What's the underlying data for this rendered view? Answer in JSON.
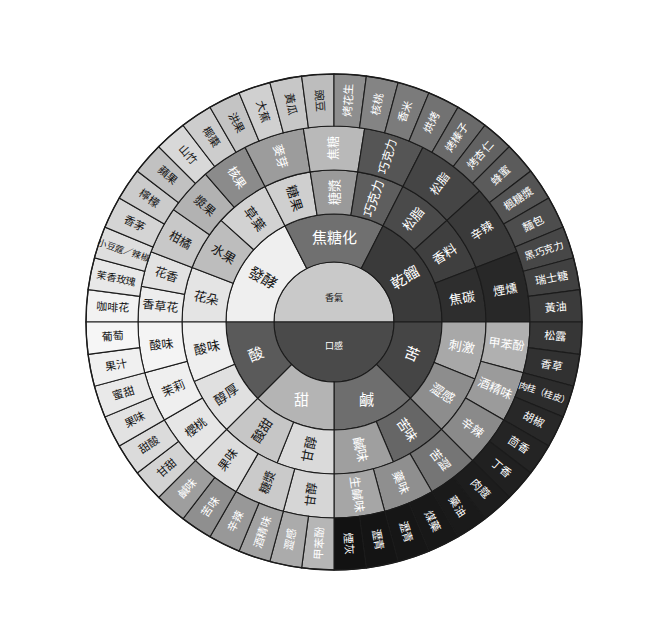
{
  "palette": {
    "aroma_core": "#c9c9c9",
    "mouthfeel_core": "#4a4a4a",
    "fermented": "#efefef",
    "caramel": "#707070",
    "dry_distill": "#3a3a3a",
    "sweet": "#b4b4b4",
    "salt": "#7a7a7a",
    "sour": "#5a5a5a",
    "bitter": "#424242",
    "outline": "#1b1b1b"
  },
  "chart_data": {
    "type": "pie",
    "center": {
      "top": "香氣",
      "bottom": "口感"
    },
    "rings": [
      {
        "ring": 1,
        "name": "核心",
        "segments": [
          {
            "label": "香氣",
            "a0": 180,
            "a1": 360,
            "fill": "#c9c9c9",
            "text": "#141414"
          },
          {
            "label": "口感",
            "a0": 0,
            "a1": 180,
            "fill": "#4a4a4a",
            "text": "#ffffff"
          }
        ]
      },
      {
        "ring": 2,
        "name": "主類別",
        "segments": [
          {
            "label": "發酵",
            "a0": 180,
            "a1": 243,
            "fill": "#efefef",
            "text": "#141414"
          },
          {
            "label": "焦糖化",
            "a0": 243,
            "a1": 297,
            "fill": "#707070",
            "text": "#ffffff"
          },
          {
            "label": "乾餾",
            "a0": 297,
            "a1": 360,
            "fill": "#3a3a3a",
            "text": "#ffffff"
          },
          {
            "label": "苦",
            "a0": 0,
            "a1": 45,
            "fill": "#454545",
            "text": "#ffffff"
          },
          {
            "label": "鹹",
            "a0": 45,
            "a1": 90,
            "fill": "#6e6e6e",
            "text": "#ffffff"
          },
          {
            "label": "甜",
            "a0": 90,
            "a1": 135,
            "fill": "#b4b4b4",
            "text": "#ffffff"
          },
          {
            "label": "酸",
            "a0": 135,
            "a1": 180,
            "fill": "#5a5a5a",
            "text": "#ffffff"
          }
        ]
      },
      {
        "ring": 3,
        "name": "次類別",
        "segments": [
          {
            "label": "花朵",
            "a0": 180,
            "a1": 201,
            "fill": "#e4e4e4",
            "text": "#141414"
          },
          {
            "label": "水果",
            "a0": 201,
            "a1": 222,
            "fill": "#bdbdbd",
            "text": "#141414"
          },
          {
            "label": "草葉",
            "a0": 222,
            "a1": 243,
            "fill": "#d2d2d2",
            "text": "#141414"
          },
          {
            "label": "糖果",
            "a0": 243,
            "a1": 261,
            "fill": "#cfcfcf",
            "text": "#141414"
          },
          {
            "label": "糖漿",
            "a0": 261,
            "a1": 279,
            "fill": "#9a9a9a",
            "text": "#ffffff"
          },
          {
            "label": "巧克力",
            "a0": 279,
            "a1": 297,
            "fill": "#5e5e5e",
            "text": "#ffffff"
          },
          {
            "label": "松脂",
            "a0": 297,
            "a1": 318,
            "fill": "#4a4a4a",
            "text": "#ffffff"
          },
          {
            "label": "香料",
            "a0": 318,
            "a1": 339,
            "fill": "#3f3f3f",
            "text": "#ffffff"
          },
          {
            "label": "焦碳",
            "a0": 339,
            "a1": 360,
            "fill": "#2e2e2e",
            "text": "#ffffff"
          },
          {
            "label": "刺激",
            "a0": 0,
            "a1": 22,
            "fill": "#a8a8a8",
            "text": "#ffffff"
          },
          {
            "label": "澀感",
            "a0": 22,
            "a1": 45,
            "fill": "#8d8d8d",
            "text": "#ffffff"
          },
          {
            "label": "苦味",
            "a0": 45,
            "a1": 67,
            "fill": "#666666",
            "text": "#ffffff"
          },
          {
            "label": "鹹味",
            "a0": 67,
            "a1": 90,
            "fill": "#9f9f9f",
            "text": "#ffffff"
          },
          {
            "label": "甘醇",
            "a0": 90,
            "a1": 112,
            "fill": "#dadada",
            "text": "#141414"
          },
          {
            "label": "酸甜",
            "a0": 112,
            "a1": 135,
            "fill": "#c6c6c6",
            "text": "#141414"
          },
          {
            "label": "醇厚",
            "a0": 135,
            "a1": 157,
            "fill": "#e0e0e0",
            "text": "#141414"
          },
          {
            "label": "酸味",
            "a0": 157,
            "a1": 180,
            "fill": "#efefef",
            "text": "#141414"
          }
        ]
      },
      {
        "ring": 4,
        "name": "細項",
        "segments": [
          {
            "label": "香草花",
            "a0": 180,
            "a1": 190.5,
            "fill": "#ededed",
            "text": "#141414"
          },
          {
            "label": "花香",
            "a0": 190.5,
            "a1": 201,
            "fill": "#e2e2e2",
            "text": "#141414"
          },
          {
            "label": "柑橘",
            "a0": 201,
            "a1": 215,
            "fill": "#c8c8c8",
            "text": "#141414"
          },
          {
            "label": "漿果",
            "a0": 215,
            "a1": 229,
            "fill": "#b2b2b2",
            "text": "#141414"
          },
          {
            "label": "核果",
            "a0": 229,
            "a1": 243,
            "fill": "#8b8b8b",
            "text": "#ffffff"
          },
          {
            "label": "麥芽",
            "a0": 243,
            "a1": 261,
            "fill": "#9c9c9c",
            "text": "#ffffff"
          },
          {
            "label": "焦糖",
            "a0": 261,
            "a1": 279,
            "fill": "#b9b9b9",
            "text": "#ffffff"
          },
          {
            "label": "巧克力",
            "a0": 279,
            "a1": 297,
            "fill": "#555555",
            "text": "#ffffff"
          },
          {
            "label": "松脂",
            "a0": 297,
            "a1": 318,
            "fill": "#454545",
            "text": "#ffffff"
          },
          {
            "label": "辛辣",
            "a0": 318,
            "a1": 339,
            "fill": "#3a3a3a",
            "text": "#ffffff"
          },
          {
            "label": "煙燻",
            "a0": 339,
            "a1": 360,
            "fill": "#282828",
            "text": "#ffffff"
          },
          {
            "label": "甲苯酚",
            "a0": 0,
            "a1": 15,
            "fill": "#b0b0b0",
            "text": "#ffffff"
          },
          {
            "label": "酒精味",
            "a0": 15,
            "a1": 30,
            "fill": "#9b9b9b",
            "text": "#ffffff"
          },
          {
            "label": "辛辣",
            "a0": 30,
            "a1": 45,
            "fill": "#8a8a8a",
            "text": "#ffffff"
          },
          {
            "label": "苦澀",
            "a0": 45,
            "a1": 60,
            "fill": "#757575",
            "text": "#ffffff"
          },
          {
            "label": "藥味",
            "a0": 60,
            "a1": 75,
            "fill": "#8f8f8f",
            "text": "#ffffff"
          },
          {
            "label": "生鹹味",
            "a0": 75,
            "a1": 90,
            "fill": "#a6a6a6",
            "text": "#ffffff"
          },
          {
            "label": "甘醇",
            "a0": 90,
            "a1": 105,
            "fill": "#d6d6d6",
            "text": "#141414"
          },
          {
            "label": "糖漿",
            "a0": 105,
            "a1": 120,
            "fill": "#cacaca",
            "text": "#141414"
          },
          {
            "label": "果味",
            "a0": 120,
            "a1": 135,
            "fill": "#dcdcdc",
            "text": "#141414"
          },
          {
            "label": "櫻桃",
            "a0": 135,
            "a1": 150,
            "fill": "#e6e6e6",
            "text": "#141414"
          },
          {
            "label": "茉莉",
            "a0": 150,
            "a1": 165,
            "fill": "#efefef",
            "text": "#141414"
          },
          {
            "label": "酸味",
            "a0": 165,
            "a1": 180,
            "fill": "#f4f4f4",
            "text": "#141414"
          }
        ]
      },
      {
        "ring": 5,
        "name": "風味描述",
        "segments": [
          {
            "label": "咖啡花",
            "a0": 180,
            "a1": 187.5,
            "fill": "#f2f2f2",
            "text": "#141414"
          },
          {
            "label": "茉香玫瑰",
            "a0": 187.5,
            "a1": 195,
            "fill": "#e8e8e8",
            "text": "#141414"
          },
          {
            "label": "小豆蔻／辣椒",
            "a0": 195,
            "a1": 202.5,
            "fill": "#dedede",
            "text": "#141414"
          },
          {
            "label": "香茅",
            "a0": 202.5,
            "a1": 210,
            "fill": "#d4d4d4",
            "text": "#141414"
          },
          {
            "label": "檸檬",
            "a0": 210,
            "a1": 217.5,
            "fill": "#cbcbcb",
            "text": "#141414"
          },
          {
            "label": "蘋果",
            "a0": 217.5,
            "a1": 225,
            "fill": "#c1c1c1",
            "text": "#141414"
          },
          {
            "label": "山竹",
            "a0": 225,
            "a1": 232.5,
            "fill": "#d8d8d8",
            "text": "#141414"
          },
          {
            "label": "椰棗",
            "a0": 232.5,
            "a1": 240,
            "fill": "#cdcdcd",
            "text": "#141414"
          },
          {
            "label": "洪果",
            "a0": 240,
            "a1": 247.5,
            "fill": "#c4c4c4",
            "text": "#141414"
          },
          {
            "label": "大蕉",
            "a0": 247.5,
            "a1": 255,
            "fill": "#d0d0d0",
            "text": "#141414"
          },
          {
            "label": "黃瓜",
            "a0": 255,
            "a1": 262.5,
            "fill": "#c7c7c7",
            "text": "#141414"
          },
          {
            "label": "豌豆",
            "a0": 262.5,
            "a1": 270,
            "fill": "#bdbdbd",
            "text": "#141414"
          },
          {
            "label": "烤花生",
            "a0": 270,
            "a1": 277.5,
            "fill": "#8e8e8e",
            "text": "#ffffff"
          },
          {
            "label": "核桃",
            "a0": 277.5,
            "a1": 285,
            "fill": "#848484",
            "text": "#ffffff"
          },
          {
            "label": "香米",
            "a0": 285,
            "a1": 292.5,
            "fill": "#7b7b7b",
            "text": "#ffffff"
          },
          {
            "label": "烘烤",
            "a0": 292.5,
            "a1": 300,
            "fill": "#727272",
            "text": "#ffffff"
          },
          {
            "label": "烤榛子",
            "a0": 300,
            "a1": 307.5,
            "fill": "#6a6a6a",
            "text": "#ffffff"
          },
          {
            "label": "烤杏仁",
            "a0": 307.5,
            "a1": 315,
            "fill": "#626262",
            "text": "#ffffff"
          },
          {
            "label": "蜂蜜",
            "a0": 315,
            "a1": 322.5,
            "fill": "#5b5b5b",
            "text": "#ffffff"
          },
          {
            "label": "楓糖漿",
            "a0": 322.5,
            "a1": 330,
            "fill": "#545454",
            "text": "#ffffff"
          },
          {
            "label": "麵包",
            "a0": 330,
            "a1": 337.5,
            "fill": "#4d4d4d",
            "text": "#ffffff"
          },
          {
            "label": "黑巧克力",
            "a0": 337.5,
            "a1": 345,
            "fill": "#474747",
            "text": "#ffffff"
          },
          {
            "label": "瑞士糖",
            "a0": 345,
            "a1": 352.5,
            "fill": "#414141",
            "text": "#ffffff"
          },
          {
            "label": "黃油",
            "a0": 352.5,
            "a1": 360,
            "fill": "#3b3b3b",
            "text": "#ffffff"
          },
          {
            "label": "松露",
            "a0": 0,
            "a1": 7.5,
            "fill": "#363636",
            "text": "#ffffff"
          },
          {
            "label": "香草",
            "a0": 7.5,
            "a1": 15,
            "fill": "#313131",
            "text": "#ffffff"
          },
          {
            "label": "肉桂（桂皮）",
            "a0": 15,
            "a1": 22.5,
            "fill": "#2c2c2c",
            "text": "#ffffff"
          },
          {
            "label": "胡椒",
            "a0": 22.5,
            "a1": 30,
            "fill": "#282828",
            "text": "#ffffff"
          },
          {
            "label": "茴香",
            "a0": 30,
            "a1": 37.5,
            "fill": "#242424",
            "text": "#ffffff"
          },
          {
            "label": "丁香",
            "a0": 37.5,
            "a1": 45,
            "fill": "#202020",
            "text": "#ffffff"
          },
          {
            "label": "肉蔻",
            "a0": 45,
            "a1": 52.5,
            "fill": "#1d1d1d",
            "text": "#ffffff"
          },
          {
            "label": "藥油",
            "a0": 52.5,
            "a1": 60,
            "fill": "#1a1a1a",
            "text": "#ffffff"
          },
          {
            "label": "煤藥",
            "a0": 60,
            "a1": 67.5,
            "fill": "#181818",
            "text": "#ffffff"
          },
          {
            "label": "瀝青",
            "a0": 67.5,
            "a1": 75,
            "fill": "#161616",
            "text": "#ffffff"
          },
          {
            "label": "瀝青",
            "a0": 75,
            "a1": 82.5,
            "fill": "#141414",
            "text": "#ffffff"
          },
          {
            "label": "煙灰",
            "a0": 82.5,
            "a1": 90,
            "fill": "#121212",
            "text": "#ffffff"
          },
          {
            "label": "甲苯酚",
            "a0": 90,
            "a1": 97.5,
            "fill": "#b6b6b6",
            "text": "#ffffff"
          },
          {
            "label": "澀感",
            "a0": 97.5,
            "a1": 105,
            "fill": "#ababab",
            "text": "#ffffff"
          },
          {
            "label": "酒精味",
            "a0": 105,
            "a1": 112.5,
            "fill": "#a1a1a1",
            "text": "#ffffff"
          },
          {
            "label": "辛辣",
            "a0": 112.5,
            "a1": 120,
            "fill": "#989898",
            "text": "#ffffff"
          },
          {
            "label": "苦味",
            "a0": 120,
            "a1": 127.5,
            "fill": "#8f8f8f",
            "text": "#ffffff"
          },
          {
            "label": "鹹味",
            "a0": 127.5,
            "a1": 135,
            "fill": "#9e9e9e",
            "text": "#ffffff"
          },
          {
            "label": "甘甜",
            "a0": 135,
            "a1": 142.5,
            "fill": "#d3d3d3",
            "text": "#141414"
          },
          {
            "label": "甜酸",
            "a0": 142.5,
            "a1": 150,
            "fill": "#dbdbdb",
            "text": "#141414"
          },
          {
            "label": "果味",
            "a0": 150,
            "a1": 157.5,
            "fill": "#e2e2e2",
            "text": "#141414"
          },
          {
            "label": "蜜甜",
            "a0": 157.5,
            "a1": 165,
            "fill": "#e9e9e9",
            "text": "#141414"
          },
          {
            "label": "果汁",
            "a0": 165,
            "a1": 172.5,
            "fill": "#f0f0f0",
            "text": "#141414"
          },
          {
            "label": "葡萄",
            "a0": 172.5,
            "a1": 180,
            "fill": "#f6f6f6",
            "text": "#141414"
          }
        ]
      }
    ],
    "radii": [
      0,
      60,
      108,
      152,
      196,
      248
    ],
    "cx": 334,
    "cy": 322,
    "grid": false,
    "legend": "none"
  }
}
